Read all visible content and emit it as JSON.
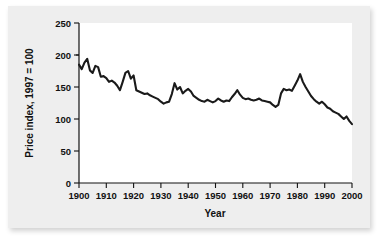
{
  "chart_data": {
    "type": "line",
    "title": "",
    "xlabel": "Year",
    "ylabel": "Price index, 1997 = 100",
    "xlim": [
      1900,
      2000
    ],
    "ylim": [
      0,
      250
    ],
    "xticks": [
      1900,
      1910,
      1920,
      1930,
      1940,
      1950,
      1960,
      1970,
      1980,
      1990,
      2000
    ],
    "yticks": [
      0,
      50,
      100,
      150,
      200,
      250
    ],
    "grid": false,
    "legend": false,
    "legend_position": "none",
    "series": [
      {
        "name": "Price index",
        "color": "#1a1a1a",
        "x": [
          1900,
          1901,
          1902,
          1903,
          1904,
          1905,
          1906,
          1907,
          1908,
          1909,
          1910,
          1911,
          1912,
          1913,
          1914,
          1915,
          1916,
          1917,
          1918,
          1919,
          1920,
          1921,
          1922,
          1923,
          1924,
          1925,
          1926,
          1927,
          1928,
          1929,
          1930,
          1931,
          1932,
          1933,
          1934,
          1935,
          1936,
          1937,
          1938,
          1939,
          1940,
          1941,
          1942,
          1943,
          1944,
          1945,
          1946,
          1947,
          1948,
          1949,
          1950,
          1951,
          1952,
          1953,
          1954,
          1955,
          1956,
          1957,
          1958,
          1959,
          1960,
          1961,
          1962,
          1963,
          1964,
          1965,
          1966,
          1967,
          1968,
          1969,
          1970,
          1971,
          1972,
          1973,
          1974,
          1975,
          1976,
          1977,
          1978,
          1979,
          1980,
          1981,
          1982,
          1983,
          1984,
          1985,
          1986,
          1987,
          1988,
          1989,
          1990,
          1991,
          1992,
          1993,
          1994,
          1995,
          1996,
          1997,
          1998,
          1999,
          2000
        ],
        "values": [
          185,
          178,
          188,
          194,
          176,
          172,
          183,
          181,
          166,
          167,
          164,
          158,
          160,
          157,
          152,
          145,
          158,
          172,
          175,
          163,
          168,
          145,
          143,
          141,
          139,
          140,
          137,
          135,
          133,
          131,
          127,
          124,
          126,
          127,
          139,
          156,
          146,
          150,
          140,
          144,
          147,
          143,
          136,
          133,
          130,
          128,
          127,
          130,
          128,
          126,
          128,
          132,
          129,
          127,
          129,
          128,
          134,
          139,
          145,
          138,
          133,
          131,
          132,
          130,
          129,
          130,
          132,
          129,
          128,
          127,
          126,
          122,
          119,
          122,
          140,
          147,
          145,
          146,
          144,
          152,
          160,
          170,
          158,
          150,
          143,
          136,
          131,
          127,
          124,
          127,
          123,
          118,
          116,
          112,
          110,
          108,
          104,
          100,
          104,
          97,
          92
        ]
      }
    ]
  },
  "axes": {
    "y_title": "Price index, 1997 = 100",
    "x_title": "Year",
    "y_tick_labels": [
      "250",
      "200",
      "150",
      "100",
      "50",
      "0"
    ],
    "x_tick_labels": [
      "1900",
      "1910",
      "1920",
      "1930",
      "1940",
      "1950",
      "1960",
      "1970",
      "1980",
      "1990",
      "2000"
    ]
  }
}
